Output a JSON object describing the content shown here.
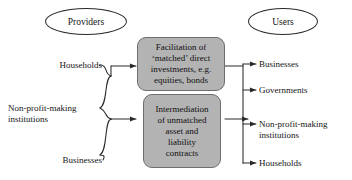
{
  "diagram": {
    "title_groups": {
      "providers": "Providers",
      "users": "Users"
    },
    "providers": [
      {
        "label": "Households"
      },
      {
        "label": "Non-profit-making\ninstitutions"
      },
      {
        "label": "Businesses"
      }
    ],
    "users": [
      {
        "label": "Businesses"
      },
      {
        "label": "Governments"
      },
      {
        "label": "Non-profit-making\ninstitutions"
      },
      {
        "label": "Households"
      }
    ],
    "processes": [
      {
        "label": "Facilitation of\n‘matched’ direct\ninvestments, e.g.\nequities, bonds"
      },
      {
        "label": "Intermediation\nof unmatched\nasset and\nliability\ncontracts"
      }
    ],
    "colors": {
      "box_fill": "#b3b3b3",
      "box_border": "#6e6e6e",
      "line": "#2a2a2a",
      "text": "#141414",
      "background": "#ffffff"
    }
  }
}
